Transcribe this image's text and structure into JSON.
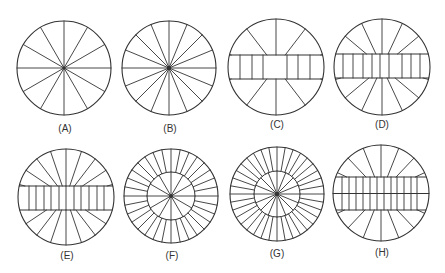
{
  "figure": {
    "stroke_color": "#333333",
    "background": "#ffffff",
    "panels": [
      {
        "id": "A",
        "label": "(A)",
        "type": "radial",
        "cx": 64,
        "cy": 68,
        "r": 47,
        "spokes": 12,
        "label_x": 65,
        "label_y": 124
      },
      {
        "id": "B",
        "label": "(B)",
        "type": "radial",
        "cx": 169,
        "cy": 68,
        "r": 47,
        "spokes": 16,
        "label_x": 170,
        "label_y": 124
      },
      {
        "id": "C",
        "label": "(C)",
        "type": "band",
        "cx": 276,
        "cy": 67,
        "r": 48,
        "band_top": 55,
        "band_bottom": 79,
        "band_mid": false,
        "band_lines": [
          240,
          252,
          263,
          287,
          298,
          310
        ],
        "spokes_per_side": 5,
        "spoke_spread": 150,
        "label_x": 277,
        "label_y": 120
      },
      {
        "id": "D",
        "label": "(D)",
        "type": "band",
        "cx": 382,
        "cy": 67,
        "r": 48,
        "band_top": 54,
        "band_bottom": 78,
        "band_mid": false,
        "band_lines": [
          343,
          353,
          363,
          372,
          380,
          389,
          402,
          411,
          420
        ],
        "spokes_per_side": 7,
        "spoke_spread": 150,
        "label_x": 382,
        "label_y": 120
      },
      {
        "id": "E",
        "label": "(E)",
        "type": "band",
        "cx": 66,
        "cy": 197,
        "r": 48,
        "band_top": 186,
        "band_bottom": 210,
        "band_mid": false,
        "band_lines": [
          29,
          36,
          44,
          51,
          59,
          66,
          74,
          81,
          89,
          97,
          104
        ],
        "spokes_per_side": 9,
        "spoke_spread": 150,
        "label_x": 67,
        "label_y": 251
      },
      {
        "id": "F",
        "label": "(F)",
        "type": "ring",
        "cx": 171,
        "cy": 196,
        "r": 47,
        "inner_r": 24,
        "inner_spokes": 12,
        "outer_spokes": 32,
        "label_x": 172,
        "label_y": 251
      },
      {
        "id": "G",
        "label": "(G)",
        "type": "ring",
        "cx": 277,
        "cy": 194,
        "r": 47,
        "inner_r": 23,
        "inner_spokes": 16,
        "outer_spokes": 36,
        "label_x": 277,
        "label_y": 249
      },
      {
        "id": "H",
        "label": "(H)",
        "type": "band",
        "cx": 381,
        "cy": 193,
        "r": 48,
        "band_top": 177,
        "band_bottom": 210,
        "band_mid": true,
        "band_lines": [
          342,
          349,
          356,
          363,
          370,
          377,
          384,
          391,
          397,
          404,
          411,
          417
        ],
        "spokes_per_side": 7,
        "spoke_spread": 130,
        "label_x": 382,
        "label_y": 248
      }
    ]
  }
}
